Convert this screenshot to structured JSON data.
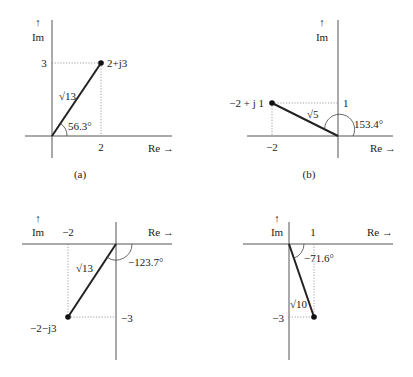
{
  "axis_labels": {
    "real": "Re →",
    "imag_arrow": "↑",
    "imag": "Im"
  },
  "panels": [
    {
      "id": "a",
      "caption": "(a)",
      "point_label": "2+j3",
      "magnitude_label": "√13",
      "angle_label": "56.3°",
      "x_tick": "2",
      "y_tick": "3",
      "point": {
        "re": 2,
        "im": 3
      }
    },
    {
      "id": "b",
      "caption": "(b)",
      "point_label": "−2 + j 1",
      "magnitude_label": "√5",
      "angle_label": "153.4°",
      "x_tick": "−2",
      "y_tick": "1",
      "point": {
        "re": -2,
        "im": 1
      }
    },
    {
      "id": "c",
      "caption": "",
      "point_label": "−2−j3",
      "magnitude_label": "√13",
      "angle_label": "−123.7°",
      "x_tick": "−2",
      "y_tick": "−3",
      "point": {
        "re": -2,
        "im": -3
      }
    },
    {
      "id": "d",
      "caption": "",
      "point_label": "",
      "magnitude_label": "√10",
      "angle_label": "−71.6°",
      "x_tick": "1",
      "y_tick": "−3",
      "point": {
        "re": 1,
        "im": -3
      }
    }
  ]
}
